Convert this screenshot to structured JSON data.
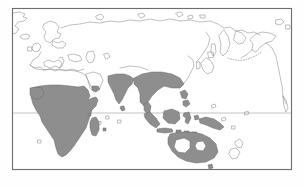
{
  "figure": {
    "kind": "distribution-map",
    "title": "",
    "projection": "equirectangular (Old World centred)",
    "frame": {
      "x": 12,
      "y": 8,
      "width": 280,
      "height": 162,
      "border_color": "#6d6d6d",
      "background_color": "#ffffff"
    },
    "page_background_color": "#ffffff"
  },
  "legend": {
    "shaded_color": "#8e8e8e",
    "unshaded_color": "#ffffff",
    "coastline_color": "#8a8a8a",
    "shaded_meaning": "distribution / range area",
    "unshaded_meaning": "outside range"
  },
  "graticule": {
    "equator": {
      "name": "equator",
      "y": 113,
      "color": "#9a9a9a",
      "visible": true
    },
    "other_lines_visible": false
  },
  "annotations": {
    "dotted_arc": {
      "name": "aleutian-island-chain",
      "visible": true,
      "color": "#7d7d7d"
    }
  },
  "regions": {
    "shaded": [
      {
        "name": "sub-saharan-africa",
        "label": "Sub-Saharan Africa"
      },
      {
        "name": "sahel-band",
        "label": "Sahel"
      },
      {
        "name": "madagascar",
        "label": "Madagascar"
      },
      {
        "name": "arabian-southwest",
        "label": "Southwest Arabia"
      },
      {
        "name": "indian-subcontinent",
        "label": "Indian subcontinent"
      },
      {
        "name": "indochina",
        "label": "Indochina"
      },
      {
        "name": "southern-china",
        "label": "Southern China"
      },
      {
        "name": "sumatra",
        "label": "Sumatra"
      },
      {
        "name": "java",
        "label": "Java"
      },
      {
        "name": "borneo",
        "label": "Borneo"
      },
      {
        "name": "sulawesi",
        "label": "Sulawesi"
      },
      {
        "name": "philippines",
        "label": "Philippines"
      },
      {
        "name": "lesser-sunda-islands",
        "label": "Lesser Sunda Islands"
      },
      {
        "name": "new-guinea",
        "label": "New Guinea"
      },
      {
        "name": "australia-coastal-belt",
        "label": "Coastal Australia"
      }
    ],
    "unshaded": [
      {
        "name": "north-africa-sahara",
        "label": "Sahara"
      },
      {
        "name": "europe",
        "label": "Europe"
      },
      {
        "name": "central-asia",
        "label": "Central Asia"
      },
      {
        "name": "siberia",
        "label": "Siberia"
      },
      {
        "name": "japan",
        "label": "Japan"
      },
      {
        "name": "alaska",
        "label": "Alaska"
      },
      {
        "name": "north-america-west",
        "label": "Western North America"
      },
      {
        "name": "new-zealand",
        "label": "New Zealand"
      },
      {
        "name": "australia-arid-interior",
        "label": "Arid interior of Australia"
      }
    ]
  }
}
